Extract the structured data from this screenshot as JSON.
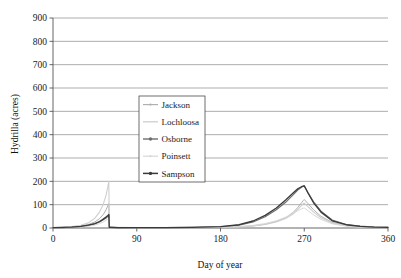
{
  "chart_data": {
    "type": "line",
    "title": "",
    "xlabel": "Day of year",
    "ylabel": "Hydrilla (acres)",
    "xlim": [
      0,
      360
    ],
    "ylim": [
      0,
      900
    ],
    "xticks": [
      0,
      90,
      180,
      270,
      360
    ],
    "yticks": [
      0,
      100,
      200,
      300,
      400,
      500,
      600,
      700,
      800,
      900
    ],
    "grid": true,
    "legend_position": "center-left",
    "legend_entries": [
      "Jackson",
      "Lochloosa",
      "Osborne",
      "Poinsett",
      "Sampson"
    ],
    "series": [
      {
        "name": "Jackson",
        "color": "#b0b0b0",
        "marker": "dot-small",
        "width": 1.0,
        "x": [
          0,
          10,
          20,
          30,
          38,
          45,
          50,
          54,
          57,
          59,
          60,
          60.5,
          62,
          70,
          90,
          120,
          150,
          180,
          200,
          215,
          228,
          240,
          250,
          258,
          263,
          267,
          269,
          270,
          274,
          280,
          288,
          300,
          315,
          330,
          345,
          360
        ],
        "y": [
          2,
          3,
          5,
          9,
          15,
          26,
          40,
          58,
          78,
          96,
          105,
          3,
          3,
          2,
          2,
          2,
          2,
          3,
          5,
          9,
          16,
          28,
          44,
          66,
          88,
          108,
          118,
          122,
          105,
          78,
          50,
          24,
          11,
          6,
          4,
          3
        ]
      },
      {
        "name": "Lochloosa",
        "color": "#cfcfcf",
        "marker": "none",
        "width": 1.1,
        "x": [
          0,
          10,
          20,
          30,
          38,
          45,
          50,
          54,
          57,
          59,
          60,
          60.5,
          62,
          70,
          90,
          120,
          150,
          180,
          200,
          215,
          228,
          240,
          250,
          258,
          263,
          267,
          269,
          270,
          274,
          280,
          288,
          300,
          315,
          330,
          345,
          360
        ],
        "y": [
          2,
          3,
          6,
          12,
          22,
          42,
          68,
          102,
          140,
          178,
          200,
          4,
          4,
          3,
          2,
          2,
          2,
          3,
          5,
          9,
          15,
          26,
          41,
          60,
          80,
          96,
          104,
          107,
          92,
          68,
          44,
          21,
          10,
          5,
          3,
          2
        ]
      },
      {
        "name": "Osborne",
        "color": "#6e6e6e",
        "marker": "dot",
        "width": 1.2,
        "x": [
          0,
          10,
          20,
          30,
          38,
          45,
          50,
          54,
          57,
          59,
          60,
          60.5,
          62,
          70,
          90,
          120,
          150,
          180,
          200,
          215,
          228,
          240,
          250,
          258,
          263,
          267,
          269,
          270,
          274,
          280,
          288,
          300,
          315,
          330,
          345,
          360
        ],
        "y": [
          2,
          2,
          4,
          7,
          11,
          18,
          26,
          35,
          43,
          50,
          54,
          3,
          3,
          2,
          2,
          2,
          3,
          5,
          12,
          26,
          48,
          78,
          110,
          142,
          163,
          175,
          179,
          180,
          152,
          112,
          72,
          34,
          15,
          8,
          4,
          3
        ]
      },
      {
        "name": "Poinsett",
        "color": "#d8d8d8",
        "marker": "dot-small",
        "width": 1.0,
        "x": [
          0,
          10,
          20,
          30,
          38,
          45,
          50,
          54,
          57,
          59,
          60,
          60.5,
          62,
          70,
          90,
          120,
          150,
          180,
          200,
          215,
          228,
          240,
          250,
          258,
          263,
          267,
          269,
          270,
          274,
          280,
          288,
          300,
          315,
          330,
          345,
          360
        ],
        "y": [
          1,
          2,
          3,
          5,
          8,
          13,
          19,
          26,
          33,
          39,
          42,
          2,
          2,
          2,
          1,
          1,
          2,
          3,
          6,
          11,
          19,
          31,
          46,
          62,
          74,
          82,
          85,
          86,
          74,
          56,
          37,
          18,
          8,
          4,
          3,
          2
        ]
      },
      {
        "name": "Sampson",
        "color": "#3a3a3a",
        "marker": "dot",
        "width": 1.3,
        "x": [
          0,
          10,
          20,
          30,
          38,
          45,
          50,
          54,
          57,
          59,
          60,
          60.5,
          62,
          70,
          90,
          120,
          150,
          180,
          200,
          215,
          228,
          240,
          250,
          258,
          263,
          267,
          269,
          270,
          274,
          280,
          288,
          300,
          315,
          330,
          345,
          360
        ],
        "y": [
          2,
          3,
          4,
          7,
          12,
          19,
          28,
          38,
          47,
          54,
          58,
          3,
          3,
          2,
          2,
          2,
          3,
          6,
          14,
          30,
          54,
          86,
          120,
          150,
          168,
          177,
          180,
          181,
          150,
          108,
          68,
          31,
          14,
          7,
          4,
          3
        ]
      }
    ]
  }
}
